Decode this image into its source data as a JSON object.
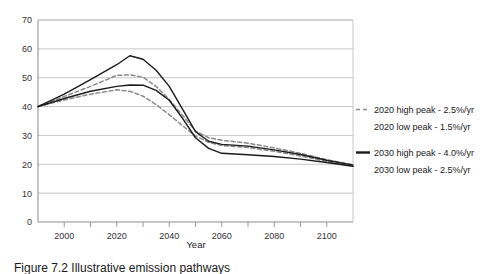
{
  "figure": {
    "caption": "Figure 7.2 Illustrative emission pathways"
  },
  "chart_data": {
    "type": "line",
    "title": "",
    "xlabel": "Year",
    "ylabel": "",
    "xlim": [
      1990,
      2110
    ],
    "ylim": [
      0,
      70
    ],
    "grid": true,
    "legend_position": "right",
    "x_ticks": [
      2000,
      2020,
      2040,
      2060,
      2080,
      2100
    ],
    "x_tick_labels": [
      "2000",
      "2020",
      "2040",
      "2060",
      "2080",
      "2100"
    ],
    "y_ticks": [
      0,
      10,
      20,
      30,
      40,
      50,
      60,
      70
    ],
    "y_tick_labels": [
      "0",
      "10",
      "20",
      "30",
      "40",
      "50",
      "60",
      "70"
    ],
    "x": [
      1990,
      2000,
      2010,
      2020,
      2025,
      2030,
      2035,
      2040,
      2045,
      2050,
      2055,
      2060,
      2070,
      2080,
      2090,
      2100,
      2110
    ],
    "series": [
      {
        "name": "2020 high peak - 2.5%/yr",
        "style": "dashed",
        "color": "#8a8a8a",
        "values": [
          40.0,
          43.5,
          47.0,
          50.8,
          51.0,
          50.2,
          47.0,
          42.5,
          37.0,
          31.5,
          29.2,
          28.3,
          27.3,
          25.7,
          23.8,
          21.6,
          19.8
        ]
      },
      {
        "name": "2020 low peak - 1.5%/yr",
        "style": "dashed",
        "color": "#8a8a8a",
        "values": [
          40.0,
          42.3,
          44.3,
          45.8,
          45.3,
          43.6,
          40.7,
          37.2,
          33.4,
          29.8,
          27.6,
          26.5,
          25.8,
          24.5,
          22.9,
          21.0,
          19.4
        ]
      },
      {
        "name": "2030 high peak - 4.0%/yr",
        "style": "solid",
        "color": "#1a1a1a",
        "values": [
          40.0,
          44.3,
          49.3,
          54.5,
          57.6,
          56.4,
          52.6,
          47.0,
          39.2,
          31.3,
          28.0,
          26.9,
          26.3,
          25.0,
          23.4,
          21.4,
          19.7
        ]
      },
      {
        "name": "2030 low peak - 2.5%/yr",
        "style": "solid",
        "color": "#1a1a1a",
        "values": [
          40.0,
          42.8,
          45.3,
          47.0,
          47.5,
          47.4,
          45.6,
          42.2,
          36.0,
          29.2,
          25.5,
          23.8,
          23.3,
          22.7,
          21.8,
          20.6,
          19.3
        ]
      }
    ],
    "legend": [
      {
        "label": "2020 high peak - 2.5%/yr",
        "style": "dashed",
        "color": "#8a8a8a"
      },
      {
        "label": "2020 low peak - 1.5%/yr",
        "style": "dashed",
        "color": "#8a8a8a"
      },
      {
        "label": "2030 high peak - 4.0%/yr",
        "style": "solid",
        "color": "#1a1a1a"
      },
      {
        "label": "2030 low peak - 2.5%/yr",
        "style": "solid",
        "color": "#1a1a1a"
      }
    ]
  }
}
